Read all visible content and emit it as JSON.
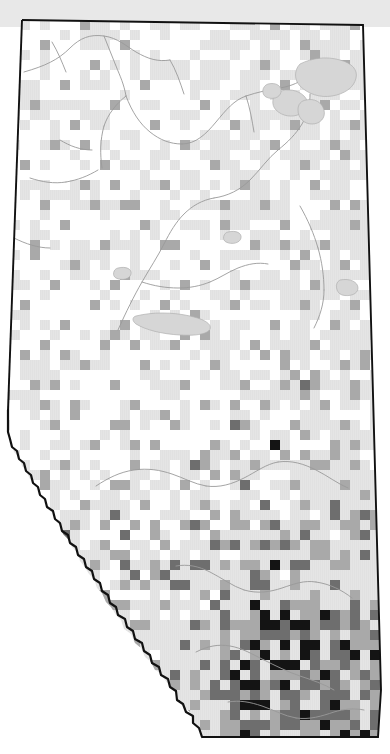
{
  "map": {
    "title": "Alberta species observation density map",
    "region_name": "Alberta",
    "country": "Canada",
    "projection_note": "province outline with gridded observation density",
    "canvas": {
      "width": 390,
      "height": 754
    },
    "colors": {
      "background": "#ffffff",
      "land_fill": "#e4e4e4",
      "outside_band": "#e8e8e8",
      "province_border": "#111111",
      "river": "#9a9a9a",
      "lake_fill": "#d2d2d2",
      "lake_stroke": "#a8a8a8",
      "grid_empty": "#ffffff",
      "density_low": "#dcdcdc",
      "density_mid": "#a9a9a9",
      "density_high": "#6e6e6e",
      "density_max": "#141414"
    },
    "legend": {
      "visible": false,
      "label": "observation density (cells per grid square)"
    },
    "labels": {
      "visible": false,
      "items": []
    },
    "grid": {
      "cell_size_px": 10,
      "origin_x": 0,
      "origin_y": 0,
      "columns": 39,
      "rows": 76
    }
  },
  "chart_data": {
    "type": "heatmap",
    "xlabel": "",
    "ylabel": "",
    "value_scale": [
      0,
      1,
      2,
      3,
      4
    ],
    "value_colors": [
      "#ffffff",
      "#dcdcdc",
      "#a9a9a9",
      "#6e6e6e",
      "#141414"
    ],
    "legend_position": "none",
    "grid": true,
    "cell_size": 10,
    "note": "Each cell is a 10x10 px grid square; value 0 = no records (white), 4 = highest density (black). Dense cluster at lower right corresponds to the Calgary corridor; secondary cluster mid-right near Edmonton.",
    "cells": [
      [
        11,
        0,
        2
      ],
      [
        13,
        0,
        2
      ],
      [
        24,
        0,
        1
      ],
      [
        29,
        0,
        2
      ],
      [
        33,
        0,
        2
      ],
      [
        8,
        2,
        2
      ],
      [
        18,
        2,
        1
      ],
      [
        27,
        2,
        2
      ],
      [
        35,
        2,
        2
      ],
      [
        4,
        4,
        2
      ],
      [
        12,
        4,
        2
      ],
      [
        21,
        4,
        1
      ],
      [
        30,
        4,
        2
      ],
      [
        9,
        6,
        2
      ],
      [
        16,
        6,
        1
      ],
      [
        26,
        6,
        2
      ],
      [
        31,
        6,
        2
      ],
      [
        34,
        6,
        2
      ],
      [
        6,
        8,
        2
      ],
      [
        14,
        8,
        2
      ],
      [
        19,
        8,
        1
      ],
      [
        28,
        8,
        2
      ],
      [
        33,
        8,
        2
      ],
      [
        3,
        10,
        2
      ],
      [
        11,
        10,
        2
      ],
      [
        20,
        10,
        2
      ],
      [
        25,
        10,
        1
      ],
      [
        32,
        10,
        2
      ],
      [
        7,
        12,
        2
      ],
      [
        15,
        12,
        2
      ],
      [
        23,
        12,
        2
      ],
      [
        29,
        12,
        2
      ],
      [
        35,
        12,
        2
      ],
      [
        5,
        14,
        2
      ],
      [
        13,
        14,
        1
      ],
      [
        18,
        14,
        2
      ],
      [
        27,
        14,
        2
      ],
      [
        33,
        14,
        2
      ],
      [
        2,
        16,
        2
      ],
      [
        10,
        16,
        2
      ],
      [
        21,
        16,
        2
      ],
      [
        30,
        16,
        2
      ],
      [
        34,
        16,
        1
      ],
      [
        8,
        18,
        2
      ],
      [
        16,
        18,
        2
      ],
      [
        24,
        18,
        2
      ],
      [
        31,
        18,
        2
      ],
      [
        4,
        20,
        2
      ],
      [
        12,
        20,
        2
      ],
      [
        19,
        20,
        1
      ],
      [
        26,
        20,
        2
      ],
      [
        33,
        20,
        2
      ],
      [
        6,
        22,
        2
      ],
      [
        14,
        22,
        2
      ],
      [
        22,
        22,
        2
      ],
      [
        28,
        22,
        2
      ],
      [
        35,
        22,
        2
      ],
      [
        3,
        24,
        2
      ],
      [
        10,
        24,
        2
      ],
      [
        17,
        24,
        2
      ],
      [
        25,
        24,
        2
      ],
      [
        32,
        24,
        2
      ],
      [
        7,
        26,
        2
      ],
      [
        13,
        26,
        1
      ],
      [
        20,
        26,
        2
      ],
      [
        29,
        26,
        2
      ],
      [
        34,
        26,
        2
      ],
      [
        5,
        28,
        2
      ],
      [
        11,
        28,
        2
      ],
      [
        18,
        28,
        2
      ],
      [
        24,
        28,
        2
      ],
      [
        31,
        28,
        2
      ],
      [
        2,
        30,
        2
      ],
      [
        9,
        30,
        2
      ],
      [
        16,
        30,
        2
      ],
      [
        23,
        30,
        2
      ],
      [
        30,
        30,
        2
      ],
      [
        35,
        30,
        2
      ],
      [
        6,
        32,
        2
      ],
      [
        12,
        32,
        2
      ],
      [
        19,
        32,
        2
      ],
      [
        27,
        32,
        2
      ],
      [
        33,
        32,
        2
      ],
      [
        4,
        34,
        2
      ],
      [
        10,
        34,
        2
      ],
      [
        17,
        34,
        2
      ],
      [
        25,
        34,
        2
      ],
      [
        31,
        34,
        2
      ],
      [
        8,
        36,
        2
      ],
      [
        14,
        36,
        2
      ],
      [
        21,
        36,
        2
      ],
      [
        28,
        36,
        2
      ],
      [
        34,
        36,
        2
      ],
      [
        3,
        38,
        2
      ],
      [
        11,
        38,
        2
      ],
      [
        18,
        38,
        2
      ],
      [
        24,
        38,
        2
      ],
      [
        30,
        38,
        3
      ],
      [
        35,
        38,
        2
      ],
      [
        7,
        40,
        2
      ],
      [
        13,
        40,
        2
      ],
      [
        20,
        40,
        2
      ],
      [
        26,
        40,
        2
      ],
      [
        32,
        40,
        2
      ],
      [
        5,
        42,
        2
      ],
      [
        12,
        42,
        2
      ],
      [
        17,
        42,
        2
      ],
      [
        23,
        42,
        3
      ],
      [
        29,
        42,
        2
      ],
      [
        34,
        42,
        2
      ],
      [
        9,
        44,
        2
      ],
      [
        15,
        44,
        2
      ],
      [
        21,
        44,
        2
      ],
      [
        27,
        44,
        4
      ],
      [
        33,
        44,
        2
      ],
      [
        6,
        46,
        2
      ],
      [
        13,
        46,
        2
      ],
      [
        19,
        46,
        3
      ],
      [
        25,
        46,
        2
      ],
      [
        31,
        46,
        2
      ],
      [
        35,
        46,
        2
      ],
      [
        4,
        48,
        2
      ],
      [
        11,
        48,
        2
      ],
      [
        18,
        48,
        2
      ],
      [
        24,
        48,
        3
      ],
      [
        29,
        48,
        2
      ],
      [
        34,
        48,
        2
      ],
      [
        8,
        50,
        2
      ],
      [
        14,
        50,
        2
      ],
      [
        20,
        50,
        2
      ],
      [
        26,
        50,
        3
      ],
      [
        30,
        50,
        2
      ],
      [
        33,
        50,
        3
      ],
      [
        7,
        52,
        2
      ],
      [
        13,
        52,
        2
      ],
      [
        19,
        52,
        3
      ],
      [
        23,
        52,
        2
      ],
      [
        27,
        52,
        3
      ],
      [
        31,
        52,
        2
      ],
      [
        35,
        52,
        2
      ],
      [
        10,
        54,
        2
      ],
      [
        16,
        54,
        2
      ],
      [
        21,
        54,
        3
      ],
      [
        25,
        54,
        2
      ],
      [
        28,
        54,
        3
      ],
      [
        32,
        54,
        2
      ],
      [
        9,
        56,
        2
      ],
      [
        15,
        56,
        2
      ],
      [
        20,
        56,
        3
      ],
      [
        24,
        56,
        2
      ],
      [
        27,
        56,
        4
      ],
      [
        30,
        56,
        3
      ],
      [
        34,
        56,
        2
      ],
      [
        12,
        58,
        2
      ],
      [
        17,
        58,
        3
      ],
      [
        22,
        58,
        2
      ],
      [
        26,
        58,
        3
      ],
      [
        29,
        58,
        2
      ],
      [
        33,
        58,
        3
      ],
      [
        11,
        60,
        2
      ],
      [
        16,
        60,
        2
      ],
      [
        21,
        60,
        3
      ],
      [
        25,
        60,
        4
      ],
      [
        28,
        60,
        3
      ],
      [
        31,
        60,
        2
      ],
      [
        35,
        60,
        3
      ],
      [
        14,
        62,
        2
      ],
      [
        19,
        62,
        3
      ],
      [
        23,
        62,
        2
      ],
      [
        26,
        62,
        4
      ],
      [
        29,
        62,
        4
      ],
      [
        32,
        62,
        3
      ],
      [
        13,
        64,
        2
      ],
      [
        18,
        64,
        3
      ],
      [
        22,
        64,
        2
      ],
      [
        25,
        64,
        4
      ],
      [
        28,
        64,
        4
      ],
      [
        30,
        64,
        4
      ],
      [
        33,
        64,
        3
      ],
      [
        36,
        64,
        2
      ],
      [
        15,
        66,
        2
      ],
      [
        20,
        66,
        3
      ],
      [
        24,
        66,
        4
      ],
      [
        27,
        66,
        4
      ],
      [
        29,
        66,
        4
      ],
      [
        31,
        66,
        3
      ],
      [
        34,
        66,
        3
      ],
      [
        17,
        68,
        2
      ],
      [
        21,
        68,
        3
      ],
      [
        25,
        68,
        4
      ],
      [
        28,
        68,
        4
      ],
      [
        30,
        68,
        3
      ],
      [
        33,
        68,
        3
      ],
      [
        36,
        68,
        2
      ],
      [
        19,
        70,
        2
      ],
      [
        23,
        70,
        3
      ],
      [
        26,
        70,
        4
      ],
      [
        29,
        70,
        3
      ],
      [
        32,
        70,
        3
      ],
      [
        35,
        70,
        2
      ],
      [
        22,
        72,
        2
      ],
      [
        25,
        72,
        3
      ],
      [
        28,
        72,
        3
      ],
      [
        31,
        72,
        2
      ],
      [
        34,
        72,
        2
      ]
    ]
  }
}
